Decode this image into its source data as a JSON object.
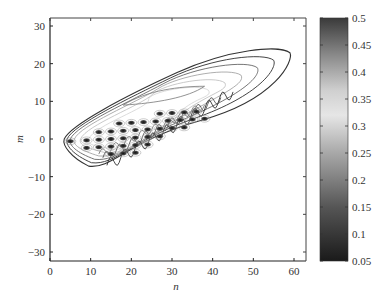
{
  "chart_data": {
    "type": "contour",
    "title": "",
    "xlabel": "n",
    "ylabel": "m",
    "xlim": [
      0,
      63
    ],
    "ylim": [
      -32,
      32
    ],
    "xticks": [
      0,
      10,
      20,
      30,
      40,
      50,
      60
    ],
    "yticks": [
      -30,
      -20,
      -10,
      0,
      10,
      20,
      30
    ],
    "xtick_labels": [
      "0",
      "10",
      "20",
      "30",
      "40",
      "50",
      "60"
    ],
    "ytick_labels": [
      "−30",
      "−20",
      "−10",
      "0",
      "10",
      "20",
      "30"
    ],
    "grid": false,
    "colorbar": {
      "min": 0.05,
      "max": 0.5,
      "ticks": [
        0.05,
        0.1,
        0.15,
        0.2,
        0.25,
        0.3,
        0.35,
        0.4,
        0.45,
        0.5
      ],
      "tick_labels": [
        "0.05",
        "0.1",
        "0.15",
        "0.2",
        "0.25",
        "0.3",
        "0.35",
        "0.4",
        "0.45",
        "0.5"
      ],
      "colormap": "gray (dark-light-dark)"
    },
    "outer_contour_extent": {
      "n_min": 3.5,
      "n_max": 59,
      "m_min": -8,
      "m_max": 25
    },
    "peak_rows": [
      {
        "m": 6,
        "n": [
          27,
          30,
          33,
          36
        ]
      },
      {
        "m": 4,
        "n": [
          17,
          20,
          23,
          26,
          29,
          32,
          35,
          38
        ]
      },
      {
        "m": 2,
        "n": [
          12,
          15,
          18,
          21,
          24,
          27,
          30,
          33
        ]
      },
      {
        "m": 0,
        "n": [
          5,
          9,
          12,
          15,
          18,
          21,
          24,
          27
        ]
      },
      {
        "m": -2,
        "n": [
          9,
          12,
          15,
          18,
          21,
          24
        ]
      },
      {
        "m": -4,
        "n": [
          15,
          18,
          21
        ]
      }
    ]
  }
}
